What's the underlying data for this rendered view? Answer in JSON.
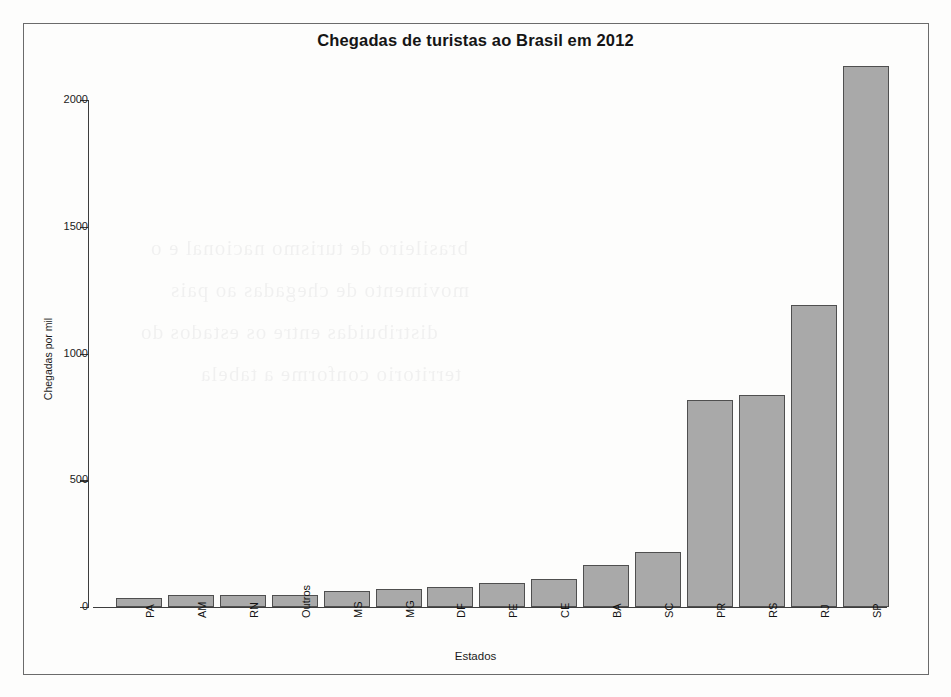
{
  "chart_data": {
    "type": "bar",
    "title": "Chegadas de turistas ao Brasil em 2012",
    "xlabel": "Estados",
    "ylabel": "Chegadas por mil",
    "categories": [
      "PA",
      "AM",
      "RN",
      "Outros",
      "MS",
      "MG",
      "DF",
      "PE",
      "CE",
      "BA",
      "SC",
      "PR",
      "RS",
      "RJ",
      "SP"
    ],
    "values": [
      35,
      47,
      47,
      47,
      63,
      71,
      79,
      95,
      110,
      165,
      218,
      815,
      835,
      1190,
      2135
    ],
    "yticks": [
      0,
      500,
      1000,
      1500,
      2000
    ],
    "ytick_labels": [
      "0",
      "500",
      "1000",
      "1500",
      "2000"
    ],
    "ylim": [
      0,
      2150
    ],
    "grid": false,
    "legend": "none",
    "bar_fill_color": "#a9a9a9",
    "bar_border_color": "#4f4f4f",
    "axis_color": "#3d3d3d"
  },
  "ghost_text": {
    "lines": [
      "brasileiro de turismo nacional e o",
      "movimento de chegadas ao pais",
      "distribuidas entre os estados do",
      "territorio conforme a tabela"
    ]
  }
}
